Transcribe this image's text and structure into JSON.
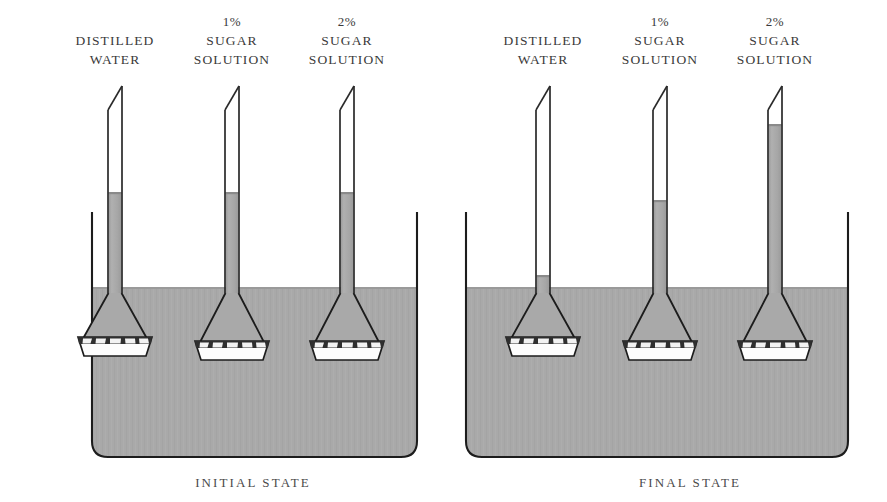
{
  "figure": {
    "type": "osmosis-osmometer-diagram",
    "background_color": "#ffffff",
    "liquid_color": "#a9a9a9",
    "liquid_edge_color": "#8f8f8f",
    "outline_color": "#1c1c1c",
    "membrane_fill": "#fdfdfd",
    "text_color": "#3a3a3a"
  },
  "panels": [
    {
      "id": "initial",
      "caption": "INITIAL  STATE",
      "beaker": {
        "left": 92,
        "right": 417,
        "rim_top": 212,
        "bottom": 457,
        "water_surface": 287,
        "corner_radius": 16
      },
      "tubes": [
        {
          "id": "distilled-water",
          "label_pct": "",
          "label_lines": [
            "DISTILLED",
            "WATER"
          ],
          "center_x": 115,
          "tube_top": 86,
          "tube_half_width": 7,
          "liquid_top": 192,
          "funnel_top": 293,
          "membrane_y": 345,
          "membrane_half_width": 36
        },
        {
          "id": "sugar-1-percent",
          "label_pct": "1%",
          "label_lines": [
            "SUGAR",
            "SOLUTION"
          ],
          "center_x": 232,
          "tube_top": 86,
          "tube_half_width": 7,
          "liquid_top": 192,
          "funnel_top": 293,
          "membrane_y": 349,
          "membrane_half_width": 36
        },
        {
          "id": "sugar-2-percent",
          "label_pct": "2%",
          "label_lines": [
            "SUGAR",
            "SOLUTION"
          ],
          "center_x": 347,
          "tube_top": 86,
          "tube_half_width": 7,
          "liquid_top": 192,
          "funnel_top": 293,
          "membrane_y": 349,
          "membrane_half_width": 36
        }
      ]
    },
    {
      "id": "final",
      "caption": "FINAL  STATE",
      "beaker": {
        "left": 466,
        "right": 848,
        "rim_top": 212,
        "bottom": 457,
        "water_surface": 287,
        "corner_radius": 16
      },
      "tubes": [
        {
          "id": "distilled-water",
          "label_pct": "",
          "label_lines": [
            "DISTILLED",
            "WATER"
          ],
          "center_x": 543,
          "tube_top": 86,
          "tube_half_width": 7,
          "liquid_top": 275,
          "funnel_top": 293,
          "membrane_y": 345,
          "membrane_half_width": 36
        },
        {
          "id": "sugar-1-percent",
          "label_pct": "1%",
          "label_lines": [
            "SUGAR",
            "SOLUTION"
          ],
          "center_x": 660,
          "tube_top": 86,
          "tube_half_width": 7,
          "liquid_top": 200,
          "funnel_top": 293,
          "membrane_y": 349,
          "membrane_half_width": 36
        },
        {
          "id": "sugar-2-percent",
          "label_pct": "2%",
          "label_lines": [
            "SUGAR",
            "SOLUTION"
          ],
          "center_x": 775,
          "tube_top": 86,
          "tube_half_width": 7,
          "liquid_top": 124,
          "funnel_top": 293,
          "membrane_y": 349,
          "membrane_half_width": 36
        }
      ]
    }
  ],
  "labels": {
    "p0_t0_pct": "",
    "p0_t0_l1": "DISTILLED",
    "p0_t0_l2": "WATER",
    "p0_t1_pct": "1%",
    "p0_t1_l1": "SUGAR",
    "p0_t1_l2": "SOLUTION",
    "p0_t2_pct": "2%",
    "p0_t2_l1": "SUGAR",
    "p0_t2_l2": "SOLUTION",
    "p1_t0_pct": "",
    "p1_t0_l1": "DISTILLED",
    "p1_t0_l2": "WATER",
    "p1_t1_pct": "1%",
    "p1_t1_l1": "SUGAR",
    "p1_t1_l2": "SOLUTION",
    "p1_t2_pct": "2%",
    "p1_t2_l1": "SUGAR",
    "p1_t2_l2": "SOLUTION",
    "caption_initial": "INITIAL  STATE",
    "caption_final": "FINAL  STATE"
  }
}
